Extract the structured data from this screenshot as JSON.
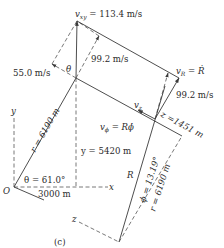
{
  "figure": {
    "caption": "(c)",
    "labels": {
      "v_xy": "v",
      "v_xy_sub": "xy",
      "v_xy_value": " = 113.4 m/s",
      "v_R": "v",
      "v_R_sub": "R",
      "v_R_eq": " = ",
      "v_R_rhs": "Ṙ",
      "v_R_component": "99.2 m/s",
      "v_R_component_2": "99.2 m/s",
      "v_theta_component": "55.0 m/s",
      "theta_small": "θ",
      "v_z": "v",
      "v_z_sub": "z",
      "v_phi": "v",
      "v_phi_sub": "ϕ",
      "v_phi_eq": " = Rϕ̇",
      "r_label": "r = 6190 m",
      "y_label": "y = 5420 m",
      "theta_label": "θ = 61.0°",
      "x_label": "3000 m",
      "origin": "O",
      "axis_x": "x",
      "axis_y": "y",
      "axis_z": "z",
      "z_label": "z =1451 m",
      "R_label": "R",
      "phi_label": "ϕ = 13.19°",
      "r_label_2": "r = 6190 m"
    },
    "values": {
      "v_xy_mps": 113.4,
      "v_R_mps": 99.2,
      "v_theta_mps": 55.0,
      "r_m": 6190,
      "x_m": 3000,
      "y_m": 5420,
      "z_m": 1451,
      "theta_deg": 61.0,
      "phi_deg": 13.19
    }
  }
}
